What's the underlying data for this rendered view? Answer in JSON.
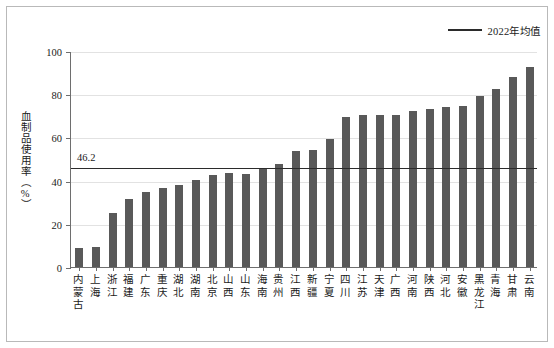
{
  "legend": {
    "marker": "line-marker",
    "label": "2022年均值"
  },
  "axes": {
    "y_title": "血制品使用率（%）",
    "y_ticks": [
      "0",
      "20",
      "40",
      "60",
      "80",
      "100"
    ],
    "y_min": 0,
    "y_max": 100
  },
  "annotation": {
    "mean_label": "46.2"
  },
  "chart_data": {
    "type": "bar",
    "title": "",
    "xlabel": "",
    "ylabel": "血制品使用率（%）",
    "ylim": [
      0,
      100
    ],
    "yticks": [
      0,
      20,
      40,
      60,
      80,
      100
    ],
    "grid": true,
    "legend_position": "top-right",
    "categories": [
      "内蒙古",
      "上海",
      "浙江",
      "福建",
      "广东",
      "重庆",
      "湖北",
      "湖南",
      "北京",
      "山西",
      "山东",
      "海南",
      "贵州",
      "江西",
      "新疆",
      "宁夏",
      "四川",
      "江苏",
      "天津",
      "广西",
      "河南",
      "陕西",
      "河北",
      "安徽",
      "黑龙江",
      "青海",
      "甘肃",
      "云南"
    ],
    "values": [
      8.8,
      9.4,
      24.8,
      31.6,
      34.8,
      36.4,
      38.2,
      40.4,
      42.6,
      43.4,
      43.0,
      45.2,
      47.8,
      53.6,
      54.2,
      59.4,
      69.6,
      70.2,
      70.4,
      70.4,
      72.2,
      73.2,
      74.2,
      74.4,
      79.4,
      82.4,
      87.8,
      92.8
    ],
    "series": [
      {
        "name": "血制品使用率",
        "type": "bar",
        "color": "#595959",
        "values": [
          8.8,
          9.4,
          24.8,
          31.6,
          34.8,
          36.4,
          38.2,
          40.4,
          42.6,
          43.4,
          43.0,
          45.2,
          47.8,
          53.6,
          54.2,
          59.4,
          69.6,
          70.2,
          70.4,
          70.4,
          72.2,
          73.2,
          74.2,
          74.4,
          79.4,
          82.4,
          87.8,
          92.8
        ]
      },
      {
        "name": "2022年均值",
        "type": "hline",
        "color": "#2b2b2b",
        "value": 46.2
      }
    ],
    "reference_line": {
      "label": "2022年均值",
      "value": 46.2,
      "display_value": "46.2"
    }
  },
  "colors": {
    "bar": "#595959",
    "mean_line": "#2b2b2b",
    "grid": "#e2e2e2",
    "axis": "#6e6e6e",
    "frame": "#b9b9b9"
  }
}
